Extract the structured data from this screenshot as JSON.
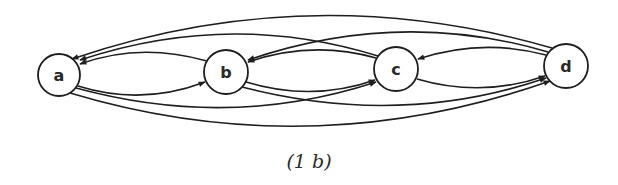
{
  "figure": {
    "caption": "(1 b)",
    "stroke_color": "#1e1e1e",
    "background": "#ffffff"
  },
  "nodes": [
    {
      "id": "a",
      "label": "a",
      "cx": 59,
      "cy": 75,
      "r": 21
    },
    {
      "id": "b",
      "label": "b",
      "cx": 226,
      "cy": 72,
      "r": 22
    },
    {
      "id": "c",
      "label": "c",
      "cx": 396,
      "cy": 69,
      "r": 22
    },
    {
      "id": "d",
      "label": "d",
      "cx": 566,
      "cy": 66,
      "r": 22
    }
  ],
  "edges": [
    {
      "from": "a",
      "to": "b",
      "side": "lower"
    },
    {
      "from": "b",
      "to": "a",
      "side": "upper"
    },
    {
      "from": "b",
      "to": "c",
      "side": "lower"
    },
    {
      "from": "c",
      "to": "b",
      "side": "upper"
    },
    {
      "from": "c",
      "to": "d",
      "side": "lower"
    },
    {
      "from": "d",
      "to": "c",
      "side": "upper"
    },
    {
      "from": "a",
      "to": "c",
      "side": "lower"
    },
    {
      "from": "c",
      "to": "a",
      "side": "upper"
    },
    {
      "from": "b",
      "to": "d",
      "side": "lower"
    },
    {
      "from": "d",
      "to": "b",
      "side": "upper"
    },
    {
      "from": "a",
      "to": "d",
      "side": "lower"
    },
    {
      "from": "d",
      "to": "a",
      "side": "upper"
    }
  ]
}
